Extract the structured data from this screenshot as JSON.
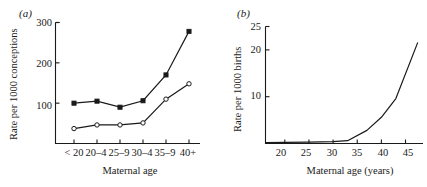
{
  "figure": {
    "background": "#ffffff",
    "ink_color": "#1a1a1a"
  },
  "panels": {
    "a": {
      "label": "(a)",
      "ylabel": "Rate per 1000 conceptions",
      "xlabel": "Maternal age",
      "ytick_labels": [
        "300",
        "200",
        "100"
      ],
      "xtick_labels": [
        "< 20",
        "20–4",
        "25–9",
        "30–4",
        "35–9",
        "40+"
      ]
    },
    "b": {
      "label": "(b)",
      "ylabel": "Rate per 1000 births",
      "xlabel": "Maternal age (years)",
      "ytick_labels": [
        "25",
        "20",
        "10"
      ],
      "xtick_labels": [
        "20",
        "25",
        "30",
        "35",
        "40",
        "45"
      ]
    }
  },
  "chart_data": [
    {
      "type": "line",
      "panel": "a",
      "title": "(a)",
      "xlabel": "Maternal age",
      "ylabel": "Rate per 1000 conceptions",
      "categories": [
        "< 20",
        "20–4",
        "25–9",
        "30–4",
        "35–9",
        "40+"
      ],
      "ylim": [
        0,
        300
      ],
      "yticks": [
        100,
        200,
        300
      ],
      "grid": false,
      "legend": "none",
      "series": [
        {
          "name": "filled-square-series",
          "marker": "filled-square",
          "color": "#1a1a1a",
          "values": [
            100,
            105,
            90,
            106,
            170,
            278
          ]
        },
        {
          "name": "open-circle-series",
          "marker": "open-circle",
          "color": "#1a1a1a",
          "values": [
            37,
            46,
            46,
            51,
            110,
            148
          ]
        }
      ]
    },
    {
      "type": "line",
      "panel": "b",
      "title": "(b)",
      "xlabel": "Maternal age (years)",
      "ylabel": "Rate per 1000 births",
      "xlim": [
        16,
        48
      ],
      "ylim": [
        0,
        25
      ],
      "yticks": [
        10,
        20,
        25
      ],
      "xticks": [
        20,
        25,
        30,
        35,
        40,
        45
      ],
      "grid": false,
      "legend": "none",
      "series": [
        {
          "name": "birth-rate-curve",
          "marker": "none",
          "color": "#1a1a1a",
          "x": [
            16,
            20,
            25,
            30,
            33,
            37,
            40,
            43,
            47.5
          ],
          "y": [
            0.2,
            0.25,
            0.3,
            0.4,
            0.6,
            2.8,
            5.6,
            9.6,
            21.5
          ]
        }
      ]
    }
  ]
}
